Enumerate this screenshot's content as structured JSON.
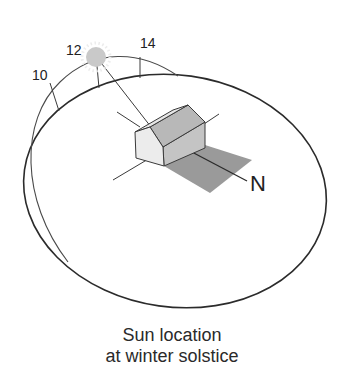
{
  "diagram": {
    "hour_labels": [
      "10",
      "12",
      "14"
    ],
    "north_label": "N",
    "caption": {
      "line1": "Sun location",
      "line2": "at winter solstice"
    },
    "colors": {
      "line": "#2b2b2b",
      "sun_fill": "#c9c9c9",
      "sun_rays": "#e2e2e2",
      "shadow": "#9a9a9a",
      "roof": "#b8b8b8",
      "gable": "#ececec",
      "side_wall": "#c4c4c4"
    }
  }
}
